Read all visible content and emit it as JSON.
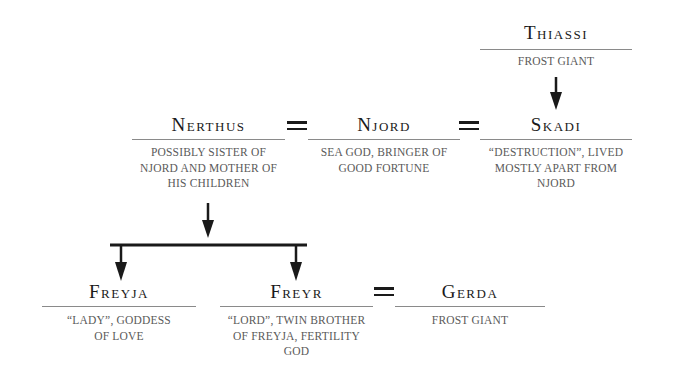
{
  "nodes": {
    "thiassi": {
      "name": "Thiassi",
      "description": "Frost giant"
    },
    "nerthus": {
      "name": "Nerthus",
      "description": "Possibly sister of Njord and mother of his children"
    },
    "njord": {
      "name": "Njord",
      "description": "Sea god, bringer of good fortune"
    },
    "skadi": {
      "name": "Skadi",
      "description": "“Destruction”, lived mostly apart from Njord"
    },
    "freyja": {
      "name": "Freyja",
      "description": "“Lady”, goddess of love"
    },
    "freyr": {
      "name": "Freyr",
      "description": "“Lord”, twin brother of Freyja, fertility god"
    },
    "gerda": {
      "name": "Gerda",
      "description": "Frost giant"
    }
  },
  "relations": {
    "marriages": [
      {
        "a": "Nerthus",
        "b": "Njord",
        "symbol": "="
      },
      {
        "a": "Njord",
        "b": "Skadi",
        "symbol": "="
      },
      {
        "a": "Freyr",
        "b": "Gerda",
        "symbol": "="
      }
    ],
    "descents": [
      {
        "from": "Thiassi",
        "to": "Skadi"
      },
      {
        "from": "Nerthus",
        "to": [
          "Freyja",
          "Freyr"
        ]
      }
    ]
  },
  "style": {
    "line_color": "#1a1a1a",
    "rule_color": "#8a8a8a",
    "desc_color": "#5a5a5a"
  }
}
